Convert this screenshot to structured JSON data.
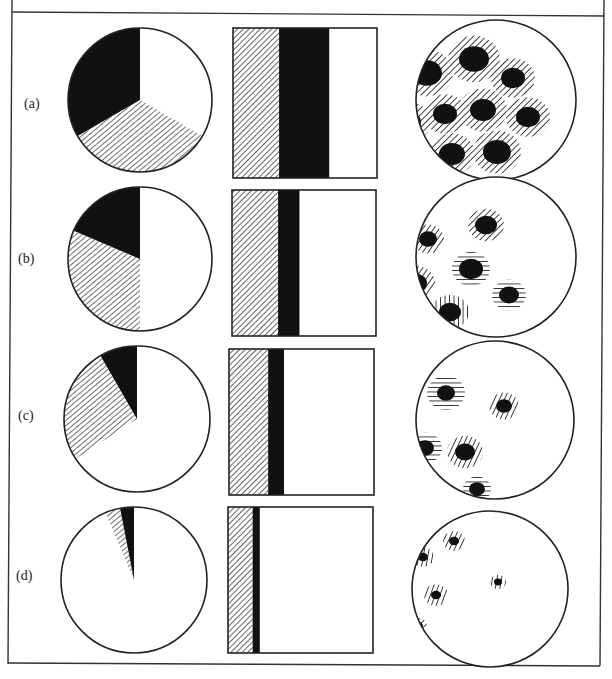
{
  "figure": {
    "frame": {
      "stroke": "#333333"
    },
    "colors": {
      "ink": "#111111",
      "paper": "#ffffff",
      "line": "#222222"
    },
    "legend_order": [
      "white",
      "hatched",
      "black"
    ],
    "rows": [
      {
        "label": "(a)",
        "label_pos": [
          24,
          110
        ],
        "pie": {
          "cx": 140,
          "cy": 100,
          "r": 72,
          "slices": [
            {
              "fill": "white",
              "start": 0,
              "end": 120
            },
            {
              "fill": "hatched",
              "start": 120,
              "end": 240
            },
            {
              "fill": "black",
              "start": 240,
              "end": 360
            }
          ]
        },
        "bar": {
          "x": 233,
          "y": 28,
          "w": 144,
          "h": 150,
          "segments": [
            {
              "fill": "hatched",
              "from": 0,
              "to": 0.32
            },
            {
              "fill": "black",
              "from": 0.32,
              "to": 0.67
            },
            {
              "fill": "white",
              "from": 0.67,
              "to": 1.0
            }
          ]
        },
        "specimen": {
          "cx": 496,
          "cy": 100,
          "r": 80,
          "particles": [
            {
              "x": 427,
              "y": 73,
              "core": 15,
              "halo": 26,
              "hatch": -45
            },
            {
              "x": 474,
              "y": 59,
              "core": 15,
              "halo": 26,
              "hatch": -45
            },
            {
              "x": 513,
              "y": 78,
              "core": 12,
              "halo": 22,
              "hatch": -45
            },
            {
              "x": 409,
              "y": 122,
              "core": 12,
              "halo": 22,
              "hatch": -45
            },
            {
              "x": 445,
              "y": 114,
              "core": 12,
              "halo": 22,
              "hatch": -45
            },
            {
              "x": 483,
              "y": 110,
              "core": 13,
              "halo": 24,
              "hatch": -45
            },
            {
              "x": 528,
              "y": 117,
              "core": 12,
              "halo": 22,
              "hatch": -45
            },
            {
              "x": 452,
              "y": 154,
              "core": 13,
              "halo": 23,
              "hatch": -45
            },
            {
              "x": 497,
              "y": 152,
              "core": 14,
              "halo": 24,
              "hatch": -45
            }
          ]
        }
      },
      {
        "label": "(b)",
        "label_pos": [
          18,
          265
        ],
        "pie": {
          "cx": 140,
          "cy": 259,
          "r": 72,
          "slices": [
            {
              "fill": "white",
              "start": 0,
              "end": 180
            },
            {
              "fill": "hatched",
              "start": 180,
              "end": 293
            },
            {
              "fill": "black",
              "start": 293,
              "end": 360
            }
          ]
        },
        "bar": {
          "x": 232,
          "y": 190,
          "w": 144,
          "h": 146,
          "segments": [
            {
              "fill": "hatched",
              "from": 0,
              "to": 0.32
            },
            {
              "fill": "black",
              "from": 0.32,
              "to": 0.47
            },
            {
              "fill": "white",
              "from": 0.47,
              "to": 1.0
            }
          ]
        },
        "specimen": {
          "cx": 496,
          "cy": 257,
          "r": 80,
          "particles": [
            {
              "x": 428,
              "y": 239,
              "core": 9,
              "halo": 16,
              "hatch": -55
            },
            {
              "x": 486,
              "y": 225,
              "core": 11,
              "halo": 18,
              "hatch": -45
            },
            {
              "x": 471,
              "y": 269,
              "core": 12,
              "halo": 19,
              "hatch": 0
            },
            {
              "x": 416,
              "y": 283,
              "core": 11,
              "halo": 19,
              "hatch": -55
            },
            {
              "x": 509,
              "y": 295,
              "core": 10,
              "halo": 17,
              "hatch": 0
            },
            {
              "x": 450,
              "y": 312,
              "core": 11,
              "halo": 19,
              "hatch": 90
            }
          ]
        }
      },
      {
        "label": "(c)",
        "label_pos": [
          18,
          422
        ],
        "pie": {
          "cx": 137,
          "cy": 419,
          "r": 73,
          "slices": [
            {
              "fill": "white",
              "start": 0,
              "end": 237
            },
            {
              "fill": "hatched",
              "start": 237,
              "end": 330
            },
            {
              "fill": "black",
              "start": 330,
              "end": 360
            }
          ]
        },
        "bar": {
          "x": 229,
          "y": 349,
          "w": 145,
          "h": 146,
          "segments": [
            {
              "fill": "hatched",
              "from": 0,
              "to": 0.27
            },
            {
              "fill": "black",
              "from": 0.27,
              "to": 0.38
            },
            {
              "fill": "white",
              "from": 0.38,
              "to": 1.0
            }
          ]
        },
        "specimen": {
          "cx": 495,
          "cy": 420,
          "r": 79,
          "particles": [
            {
              "x": 446,
              "y": 393,
              "core": 9,
              "halo": 19,
              "hatch": 0
            },
            {
              "x": 504,
              "y": 406,
              "core": 8,
              "halo": 15,
              "hatch": -65
            },
            {
              "x": 425,
              "y": 448,
              "core": 9,
              "halo": 17,
              "hatch": 0
            },
            {
              "x": 465,
              "y": 452,
              "core": 10,
              "halo": 18,
              "hatch": -65
            },
            {
              "x": 477,
              "y": 489,
              "core": 8,
              "halo": 14,
              "hatch": 0
            }
          ]
        }
      },
      {
        "label": "(d)",
        "label_pos": [
          16,
          582
        ],
        "pie": {
          "cx": 134,
          "cy": 580,
          "r": 73,
          "slices": [
            {
              "fill": "white",
              "start": 0,
              "end": 337
            },
            {
              "fill": "hatched",
              "start": 337,
              "end": 349
            },
            {
              "fill": "black",
              "start": 349,
              "end": 360
            }
          ]
        },
        "bar": {
          "x": 228,
          "y": 507,
          "w": 145,
          "h": 146,
          "segments": [
            {
              "fill": "hatched",
              "from": 0,
              "to": 0.17
            },
            {
              "fill": "black",
              "from": 0.17,
              "to": 0.22
            },
            {
              "fill": "white",
              "from": 0.22,
              "to": 1.0
            }
          ]
        },
        "specimen": {
          "cx": 490,
          "cy": 589,
          "r": 78,
          "particles": [
            {
              "x": 423,
              "y": 557,
              "core": 5,
              "halo": 11,
              "hatch": -80
            },
            {
              "x": 454,
              "y": 541,
              "core": 5,
              "halo": 11,
              "hatch": -65
            },
            {
              "x": 436,
              "y": 595,
              "core": 5,
              "halo": 12,
              "hatch": -70
            },
            {
              "x": 498,
              "y": 582,
              "core": 4,
              "halo": 8,
              "hatch": -80
            },
            {
              "x": 418,
              "y": 626,
              "core": 5,
              "halo": 9,
              "hatch": -45
            }
          ]
        }
      }
    ]
  }
}
